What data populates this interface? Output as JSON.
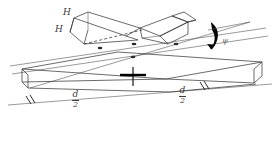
{
  "figure": {
    "type": "engineering-isometric-diagram",
    "background_color": "#ffffff",
    "line_color": "#3a3a3a",
    "accent_color": "#000000",
    "labels": {
      "height_upper": "H",
      "height_lower": "H",
      "angle": "ψ",
      "dimension_left_numerator": "d",
      "dimension_left_denominator": "2",
      "dimension_right_numerator": "d",
      "dimension_right_denominator": "2"
    },
    "annotations": {
      "hidden_edge_style": "dashed",
      "centerline_marker": "bold cross",
      "tick_marks": "double slash",
      "rotation_arrow": "curved bold arrow"
    }
  }
}
